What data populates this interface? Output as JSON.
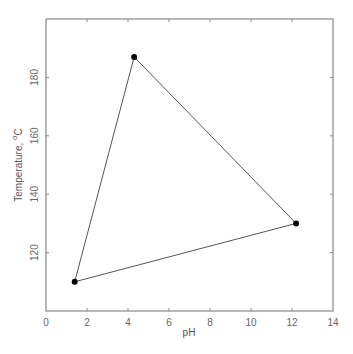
{
  "chart_data": {
    "type": "line",
    "title": "",
    "xlabel": "pH",
    "ylabel": "Temperature, °C",
    "ylabel_parts": {
      "text": "Temperature, ",
      "sup": "o",
      "unit": "C"
    },
    "xlim": [
      0,
      14
    ],
    "ylim": [
      100,
      200
    ],
    "xticks": [
      0,
      2,
      4,
      6,
      8,
      10,
      12,
      14
    ],
    "yticks": [
      120,
      140,
      160,
      180
    ],
    "grid": false,
    "legend": null,
    "series": [
      {
        "name": "triangle",
        "closed": true,
        "marker": "filled-circle",
        "points": [
          {
            "x": 1.4,
            "y": 110
          },
          {
            "x": 4.3,
            "y": 187
          },
          {
            "x": 12.2,
            "y": 130
          }
        ]
      }
    ]
  },
  "colors": {
    "frame": "#888888",
    "line": "#555555",
    "marker": "#000000",
    "text": "#666666"
  }
}
